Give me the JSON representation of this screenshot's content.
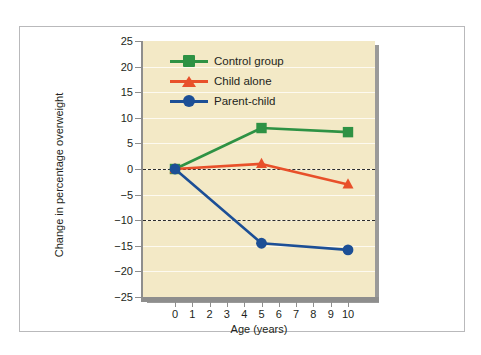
{
  "figure": {
    "background_color": "#ffffff",
    "frame_color": "#b9b9bb",
    "plot_background_color": "#f3e9c6",
    "axis_color": "#8e8e8d"
  },
  "chart_data": {
    "type": "line",
    "title": "",
    "xlabel": "Age (years)",
    "ylabel": "Change in percentage overweight",
    "xlim": [
      0,
      10
    ],
    "ylim": [
      -25,
      25
    ],
    "xticks": [
      0,
      1,
      2,
      3,
      4,
      5,
      6,
      7,
      8,
      9,
      10
    ],
    "xtick_labels": [
      "0",
      "1",
      "2",
      "3",
      "4",
      "5",
      "6",
      "7",
      "8",
      "9",
      "10"
    ],
    "yticks": [
      25,
      20,
      15,
      10,
      5,
      0,
      -5,
      -10,
      -15,
      -20,
      -25
    ],
    "ytick_labels": [
      "25",
      "20",
      "15",
      "10",
      "5",
      "0",
      "−5",
      "−10",
      "−15",
      "−20",
      "−25"
    ],
    "grid": true,
    "grid_color": "#fdfaf0",
    "legend_position": "upper left",
    "reference_lines": [
      {
        "value": 0,
        "style": "dashed",
        "color": "#2b2b2b"
      },
      {
        "value": -10,
        "style": "dashed",
        "color": "#2b2b2b"
      }
    ],
    "x": [
      0,
      5,
      10
    ],
    "series": [
      {
        "name": "Control group",
        "color": "#2e9244",
        "marker": "square",
        "values": [
          0,
          8,
          7.2
        ]
      },
      {
        "name": "Child alone",
        "color": "#e8502a",
        "marker": "triangle",
        "values": [
          0,
          1,
          -3
        ]
      },
      {
        "name": "Parent-child",
        "color": "#1c4f96",
        "marker": "circle",
        "values": [
          0,
          -14.5,
          -15.8
        ]
      }
    ]
  }
}
